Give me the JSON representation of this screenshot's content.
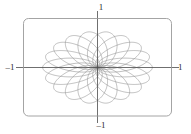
{
  "figure": {
    "title": "",
    "frame": {
      "x": 23.5,
      "y": 18.5,
      "width": 148,
      "height": 97.5,
      "corner_radius": 5,
      "stroke": "#9a9a9a",
      "stroke_width": 0.9
    },
    "axes": {
      "stroke": "#4a4a4a",
      "stroke_width": 0.8,
      "origin_x": 97.5,
      "origin_y": 67.5
    },
    "labels": {
      "top": "1",
      "bottom": "–1",
      "left": "–1",
      "right": "1"
    },
    "curve": {
      "stroke": "#8c8c8c",
      "stroke_width": 0.55,
      "opacity": 0.95
    }
  },
  "chart_data": {
    "type": "line",
    "title": "",
    "xlabel": "",
    "ylabel": "",
    "xlim": [
      -1.35,
      1.35
    ],
    "ylim": [
      -1.35,
      1.35
    ],
    "grid": false,
    "legend": false,
    "x_ticks": [
      -1,
      1
    ],
    "x_ticklabels": [
      "–1",
      "1"
    ],
    "y_ticks": [
      -1,
      1
    ],
    "y_ticklabels": [
      "–1",
      "1"
    ],
    "series": [
      {
        "name": "rotated ellipse family",
        "kind": "parametric",
        "parametric": "x(t) = a*cos(t)*cos(phi) - b*sin(t)*sin(phi) + a*cos(phi);  y(t) = a*cos(t)*sin(phi) + b*sin(t)*cos(phi) + a*sin(phi)",
        "semi_major_a": 0.5,
        "semi_minor_b": 0.26,
        "count": 18,
        "rotation_step_deg": 20,
        "angles_deg": [
          0,
          20,
          40,
          60,
          80,
          100,
          120,
          140,
          160,
          180,
          200,
          220,
          240,
          260,
          280,
          300,
          320,
          340
        ],
        "x_scale": 1.0,
        "y_scale": 0.68
      }
    ]
  }
}
